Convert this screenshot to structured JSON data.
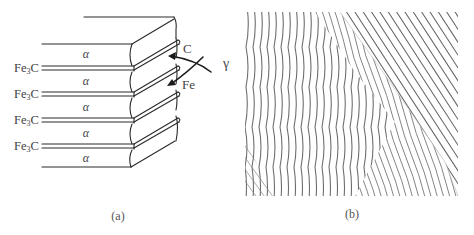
{
  "figure": {
    "panels": [
      {
        "id": "a",
        "caption": "(a)",
        "type": "schematic",
        "layer_labels": {
          "ferrite": [
            "α",
            "α",
            "α",
            "α",
            "α"
          ],
          "cementite": [
            "Fe3C",
            "Fe3C",
            "Fe3C",
            "Fe3C"
          ]
        },
        "cementite_parts": {
          "base": "Fe",
          "sub": "3",
          "tail": "C"
        },
        "diffusion": {
          "carbon_label": "C",
          "iron_label": "Fe",
          "parent_phase_label": "γ"
        }
      },
      {
        "id": "b",
        "caption": "(b)",
        "type": "micrograph",
        "description": "lamellar pearlite microstructure"
      }
    ]
  }
}
